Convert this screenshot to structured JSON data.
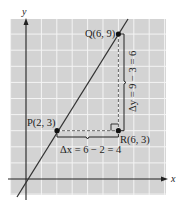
{
  "diagram": {
    "type": "coordinate-plane-slope",
    "axes": {
      "x_label": "x",
      "y_label": "y"
    },
    "points": {
      "P": {
        "label": "P(2, 3)",
        "x": 2,
        "y": 3
      },
      "Q": {
        "label": "Q(6, 9)",
        "x": 6,
        "y": 9
      },
      "R": {
        "label": "R(6, 3)",
        "x": 6,
        "y": 3
      }
    },
    "delta_x_label": "Δx = 6 − 2 = 4",
    "delta_y_label": "Δy = 9 − 3 = 6",
    "colors": {
      "grid_background": "#d3d3d3",
      "grid_lines": "#f4f4f4",
      "ink": "#222222"
    }
  }
}
